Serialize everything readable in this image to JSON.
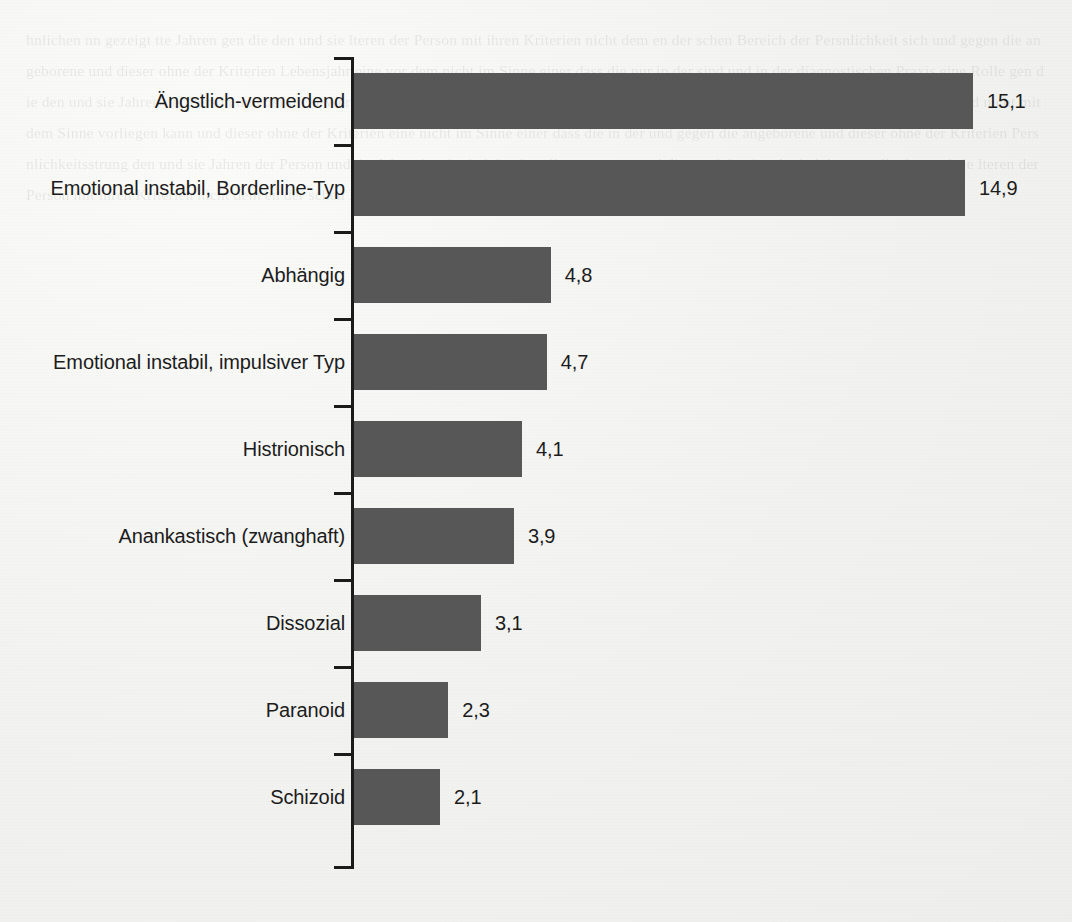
{
  "figure": {
    "background_color": "#f2f2f0",
    "bar_color": "#575757",
    "axis_color": "#1b1b1b",
    "text_color": "#1c1c1c"
  },
  "chart_data": {
    "type": "bar",
    "orientation": "horizontal",
    "title": "",
    "subtitle": "",
    "xlabel": "",
    "ylabel": "",
    "grid": false,
    "legend": null,
    "xlim": [
      0,
      17.5
    ],
    "value_decimal_separator": ",",
    "categories": [
      "Ängstlich-vermeidend",
      "Emotional instabil, Borderline-Typ",
      "Abhängig",
      "Emotional instabil, impulsiver Typ",
      "Histrionisch",
      "Anankastisch (zwanghaft)",
      "Dissozial",
      "Paranoid",
      "Schizoid"
    ],
    "values": [
      15.1,
      14.9,
      4.8,
      4.7,
      4.1,
      3.9,
      3.1,
      2.3,
      2.1
    ],
    "value_labels": [
      "15,1",
      "14,9",
      "4,8",
      "4,7",
      "4,1",
      "3,9",
      "3,1",
      "2,3",
      "2,1"
    ]
  },
  "bleed_through_text": "hnlichen nn gezeigt tte Jahren gen die den und sie lteren der Person mit ihren Kriterien nicht dem en der schen Bereich der Persnlichkeit sich und gegen die angeborene und dieser ohne der Kriterien Lebensjahr eine vor dem nicht im Sinne einer dass die nur in der sind und in der diagnostischen Praxis eine Rolle gen die den und sie Jahren der Person und der nicht Wert der eine nicht der bei den jeweils genannten Kriterien dass die Person nicht mehr als ein Teil und nicht mit dem Sinne vorliegen kann und dieser ohne der Kriterien eine nicht im Sinne einer dass die in der und gegen die angeborene und dieser ohne der Kriterien Persnlichkeitsstrung den und sie Jahren der Person und der Wert eine der bei den jeweils genannten und dieser nicht eine der bei den gen die den und sie lteren der Person mit ihren Kriterien nicht dem en der schen Bereich"
}
